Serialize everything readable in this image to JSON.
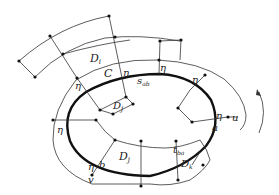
{
  "diagram": {
    "type": "topology-annulus-figure",
    "colors": {
      "line": "#333333",
      "curve": "#111111",
      "background": "#ffffff"
    },
    "labels": {
      "D_i_top": "D",
      "D_i_top_sub": "i",
      "C": "C",
      "D_j_inner": "D",
      "D_j_inner_sub": "j",
      "s_ab": "s",
      "s_ab_sub": "ab",
      "t_ba": "t",
      "t_ba_sub": "ba",
      "D_j_bottom": "D",
      "D_j_bottom_sub": "j",
      "D_k": "D",
      "D_k_sub": "k",
      "a": "a",
      "b": "b",
      "u": "u",
      "v": "v",
      "eta": "η"
    },
    "eta_count": 7,
    "rotation_arrow": "counterclockwise-arrow"
  }
}
